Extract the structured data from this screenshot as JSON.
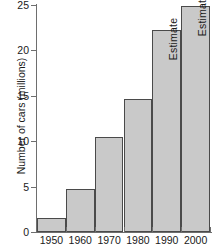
{
  "chart_data": {
    "type": "bar",
    "title": "",
    "xlabel": "",
    "ylabel": "Number of cars (millions)",
    "categories": [
      "1950",
      "1960",
      "1970",
      "1980",
      "1990",
      "2000"
    ],
    "values": [
      1.5,
      4.7,
      10.5,
      14.7,
      22.2,
      24.9
    ],
    "ylim": [
      0,
      25
    ],
    "ytick_labels": [
      "0",
      "5",
      "10",
      "15",
      "20",
      "25"
    ],
    "ytick_values": [
      0,
      5,
      10,
      15,
      20,
      25
    ],
    "grid": false,
    "legend": null,
    "bar_color": "#c9c9c9",
    "bar_edge_color": "#4a4a4a",
    "axis_color": "#6e6e6e",
    "text_color": "#1a1a1a",
    "annotations": [
      {
        "category": "1990",
        "text": "Estimate",
        "rotation": -90
      },
      {
        "category": "2000",
        "text": "Estimate",
        "rotation": -90
      }
    ]
  }
}
